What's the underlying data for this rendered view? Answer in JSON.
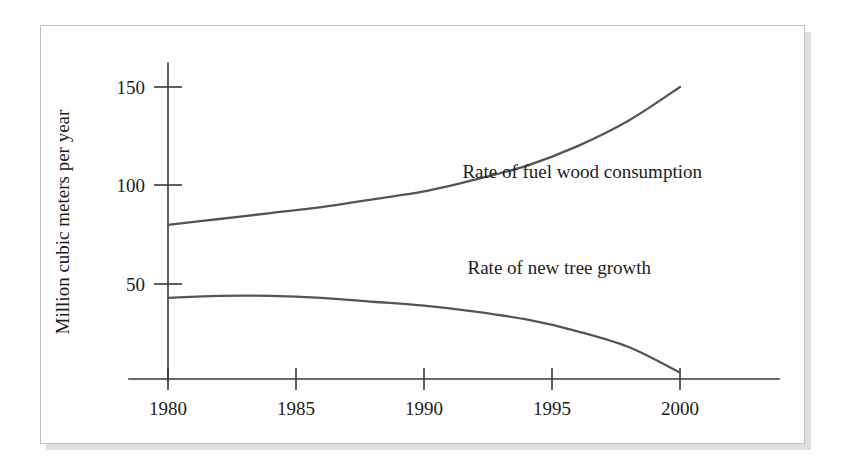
{
  "figure": {
    "background_color": "#ffffff",
    "frame_border_color": "#c2c2c2",
    "shadow_color": "#d9d9d9",
    "line_color": "#555555",
    "axis_color": "#3a3a3a",
    "text_color": "#1c1c1c"
  },
  "chart_data": {
    "type": "line",
    "title": "",
    "xlabel": "",
    "ylabel": "Million cubic meters per year",
    "xlim": [
      1980,
      2000
    ],
    "ylim": [
      0,
      160
    ],
    "x_ticks": [
      1980,
      1985,
      1990,
      1995,
      2000
    ],
    "x_tick_labels": [
      "1980",
      "1985",
      "1990",
      "1995",
      "2000"
    ],
    "y_ticks": [
      50,
      100,
      150
    ],
    "y_tick_labels": [
      "50",
      "100",
      "150"
    ],
    "grid": false,
    "legend_position": "inline-annotation",
    "x": [
      1980,
      1982,
      1984,
      1986,
      1988,
      1990,
      1992,
      1994,
      1996,
      1998,
      2000
    ],
    "series": [
      {
        "name": "Rate of fuel wood consumption",
        "label": "Rate of fuel wood consumption",
        "values": [
          80,
          83,
          86,
          89,
          93,
          97,
          103,
          110,
          120,
          133,
          150
        ],
        "annotation": "Rate of fuel wood consumption",
        "annotation_x": 1991.5,
        "annotation_y": 104
      },
      {
        "name": "Rate of new tree growth",
        "label": "Rate of new tree growth",
        "values": [
          43,
          44,
          44,
          43,
          41,
          39,
          36,
          32,
          26,
          18,
          5
        ],
        "annotation": "Rate of new tree growth",
        "annotation_x": 1991.7,
        "annotation_y": 55
      }
    ]
  }
}
